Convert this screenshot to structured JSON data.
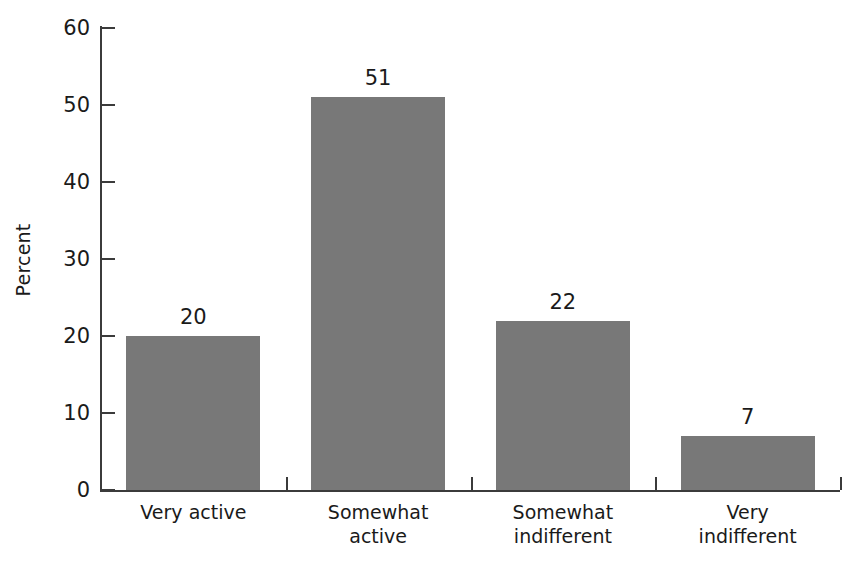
{
  "chart_data": {
    "type": "bar",
    "title": "",
    "subtitle": "",
    "xlabel": "",
    "ylabel": "Percent",
    "categories": [
      "Very active",
      "Somewhat active",
      "Somewhat indifferent",
      "Very indifferent"
    ],
    "category_label_lines": [
      [
        "Very active"
      ],
      [
        "Somewhat",
        "active"
      ],
      [
        "Somewhat",
        "indifferent"
      ],
      [
        "Very indifferent"
      ]
    ],
    "values": [
      20,
      51,
      22,
      7
    ],
    "value_labels": [
      "20",
      "51",
      "22",
      "7"
    ],
    "ylim": [
      0,
      60
    ],
    "yticks": [
      0,
      10,
      20,
      30,
      40,
      50,
      60
    ],
    "ytick_labels": [
      "0",
      "10",
      "20",
      "30",
      "40",
      "50",
      "60"
    ],
    "grid": false,
    "legend": null,
    "bar_color": "#787878",
    "axis_color": "#3b3b3b",
    "text_color": "#1a1a1a",
    "background": "#ffffff"
  }
}
